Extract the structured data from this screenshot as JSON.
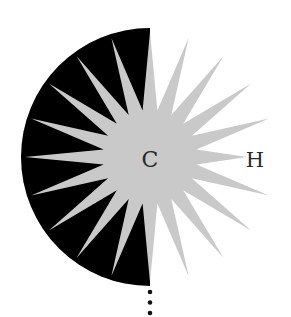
{
  "diagram": {
    "atoms": {
      "center_label": "C",
      "neighbor_label": "H"
    },
    "rays": {
      "count": 20,
      "angular_step_degrees": 18
    },
    "colors": {
      "ray_fill": "#c9c9c9",
      "shaded_half": "#000000",
      "dots": "#111111",
      "label": "#2a2a2a",
      "background": "#ffffff"
    },
    "shaded_half_side": "left",
    "continuation_dots": 3
  }
}
